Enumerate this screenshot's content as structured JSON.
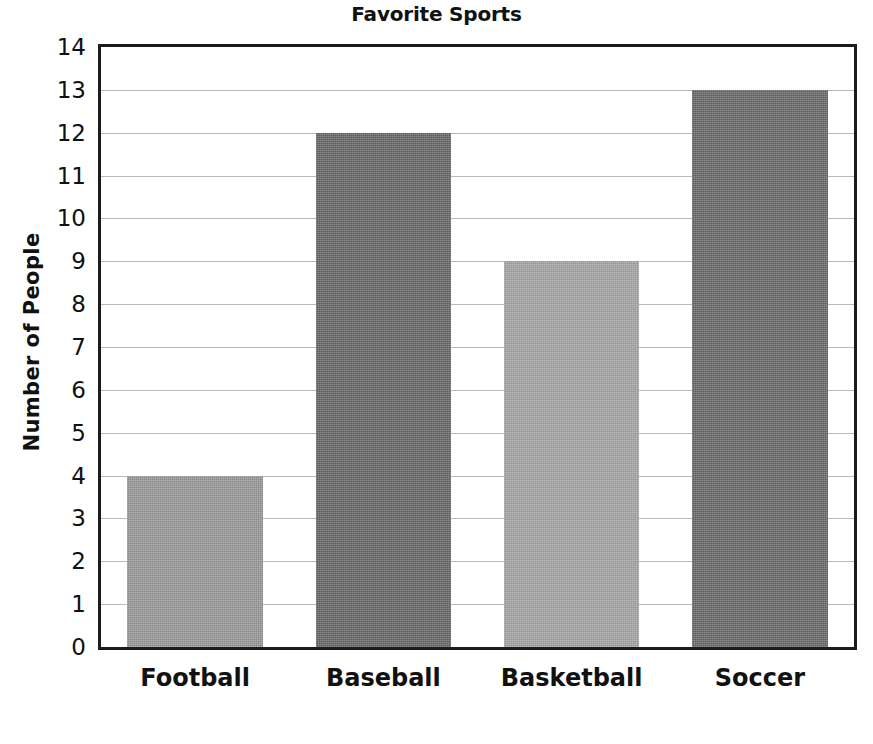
{
  "chart_data": {
    "type": "bar",
    "title": "Favorite Sports",
    "xlabel": "",
    "ylabel": "Number of People",
    "categories": [
      "Football",
      "Baseball",
      "Basketball",
      "Soccer"
    ],
    "values": [
      4,
      12,
      9,
      13
    ],
    "bar_colors": [
      "#9c9c9c",
      "#6b6b6b",
      "#a9a9a9",
      "#6d6d6d"
    ],
    "ylim": [
      0,
      14
    ],
    "ytick_step": 1,
    "yticks": [
      14,
      13,
      12,
      11,
      10,
      9,
      8,
      7,
      6,
      5,
      4,
      3,
      2,
      1,
      0
    ],
    "grid": true,
    "grid_color": "#b9b9b9",
    "axis_color": "#1b1b1b",
    "legend": "none",
    "background": "#ffffff"
  }
}
